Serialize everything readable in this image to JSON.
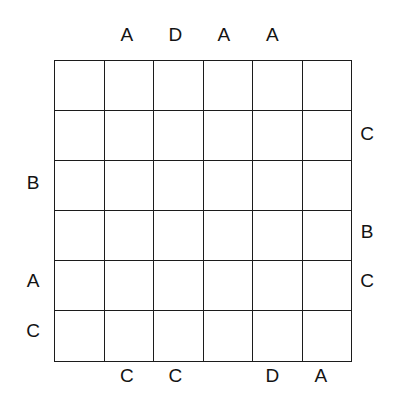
{
  "puzzle": {
    "type": "grid-clue-puzzle",
    "grid": {
      "rows": 6,
      "columns": 6,
      "line_color": "#1c1c1c",
      "cell_fill": "#ffffff",
      "cells": [
        [
          "",
          "",
          "",
          "",
          "",
          ""
        ],
        [
          "",
          "",
          "",
          "",
          "",
          ""
        ],
        [
          "",
          "",
          "",
          "",
          "",
          ""
        ],
        [
          "",
          "",
          "",
          "",
          "",
          ""
        ],
        [
          "",
          "",
          "",
          "",
          "",
          ""
        ],
        [
          "",
          "",
          "",
          "",
          "",
          ""
        ]
      ]
    },
    "labels": {
      "top": [
        "",
        "A",
        "D",
        "A",
        "A",
        ""
      ],
      "bottom": [
        "",
        "C",
        "C",
        "",
        "D",
        "A"
      ],
      "left": [
        "",
        "",
        "B",
        "",
        "A",
        "C"
      ],
      "right": [
        "",
        "C",
        "",
        "B",
        "C",
        ""
      ]
    },
    "text_color": "#131313"
  }
}
